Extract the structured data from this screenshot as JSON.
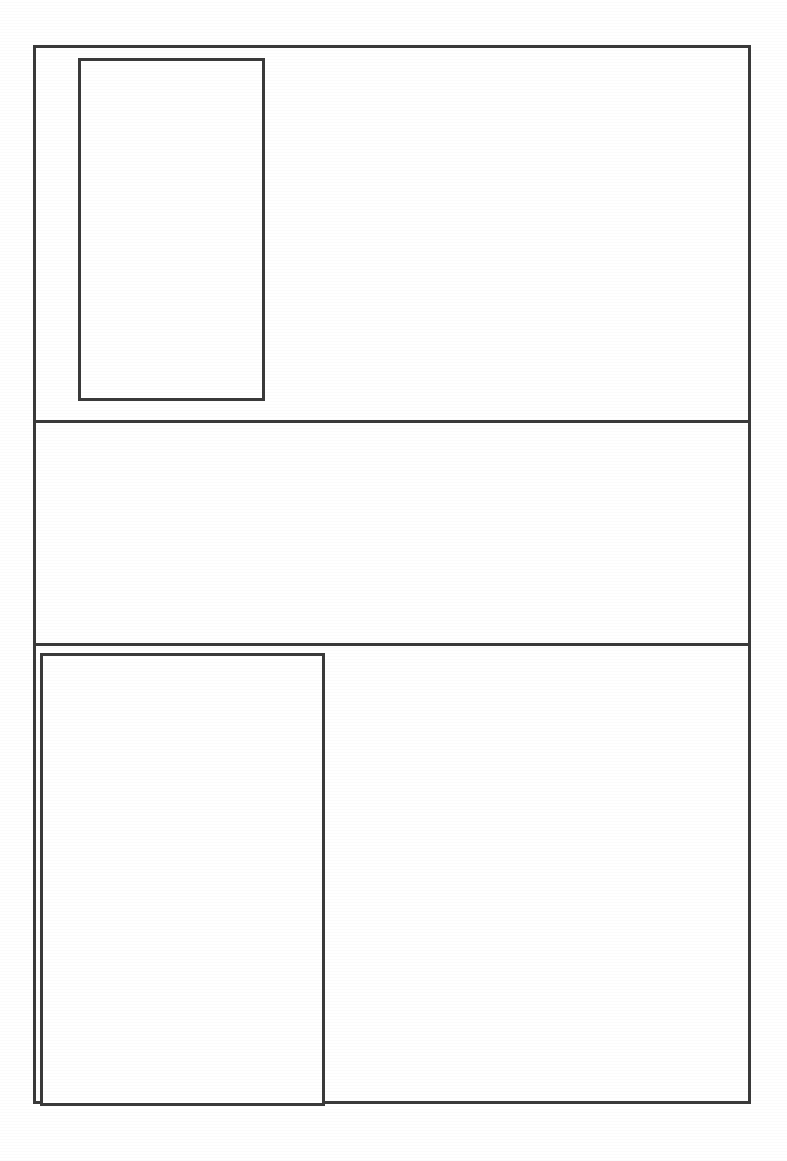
{
  "document": {
    "kind": "scanned-blank-form-layout",
    "page_background_color": "#ffffff",
    "line_color": "#3a3a3a",
    "line_width_px": 3,
    "canvas_width_px": 787,
    "canvas_height_px": 1161,
    "visible_text": "",
    "notes": ""
  },
  "frame": {
    "label": "",
    "x": 33,
    "y": 45,
    "width": 718,
    "height": 1059
  },
  "dividers": [
    {
      "label": "",
      "y": 420
    },
    {
      "label": "",
      "y": 643
    }
  ],
  "regions": [
    {
      "label": "",
      "position": "top",
      "y": 45,
      "height": 375,
      "content": ""
    },
    {
      "label": "",
      "position": "middle",
      "y": 423,
      "height": 220,
      "content": ""
    },
    {
      "label": "",
      "position": "bottom",
      "y": 646,
      "height": 458,
      "content": ""
    }
  ],
  "boxes": [
    {
      "label": "",
      "region": "top",
      "x": 78,
      "y": 58,
      "width": 187,
      "height": 343,
      "fill": "#ffffff",
      "content": ""
    },
    {
      "label": "",
      "region": "bottom",
      "x": 40,
      "y": 653,
      "width": 285,
      "height": 453,
      "fill": "#ffffff",
      "content": ""
    }
  ]
}
